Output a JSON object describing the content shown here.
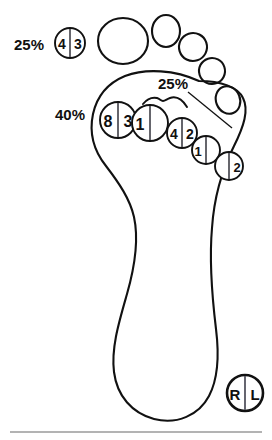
{
  "figure": {
    "laterality": {
      "left_letter": "R",
      "right_letter": "L"
    },
    "percent_labels": [
      {
        "id": "toe-region",
        "text": "25%",
        "x": 14,
        "y": 50
      },
      {
        "id": "midfoot-region",
        "text": "25%",
        "x": 158,
        "y": 89
      },
      {
        "id": "heel-region",
        "text": "40%",
        "x": 55,
        "y": 120
      }
    ],
    "toes": [
      {
        "id": "hallux",
        "cx": 123,
        "cy": 41,
        "rx": 25,
        "ry": 23
      },
      {
        "id": "toe-2",
        "cx": 166,
        "cy": 31,
        "rx": 14,
        "ry": 16
      },
      {
        "id": "toe-3",
        "cx": 193,
        "cy": 47,
        "rx": 14,
        "ry": 14
      },
      {
        "id": "toe-4",
        "cx": 212,
        "cy": 71,
        "rx": 13,
        "ry": 13
      },
      {
        "id": "toe-5",
        "cx": 228,
        "cy": 100,
        "rx": 12,
        "ry": 14
      }
    ],
    "markers": [
      {
        "id": "marker-toe-43",
        "left": "4",
        "right": "3",
        "cx": 70,
        "cy": 43,
        "r": 15,
        "font": 14
      },
      {
        "id": "marker-mtp-83",
        "left": "8",
        "right": "3",
        "cx": 118,
        "cy": 120,
        "r": 18,
        "font": 16
      },
      {
        "id": "marker-mtp-1",
        "left": "1",
        "right": "",
        "cx": 150,
        "cy": 123,
        "r": 18,
        "font": 16
      },
      {
        "id": "marker-mtp-42",
        "left": "4",
        "right": "2",
        "cx": 182,
        "cy": 133,
        "r": 15,
        "font": 14
      },
      {
        "id": "marker-mtp-1b",
        "left": "1",
        "right": "",
        "cx": 206,
        "cy": 150,
        "r": 14,
        "font": 13
      },
      {
        "id": "marker-mtp-2",
        "left": "",
        "right": "2",
        "cx": 229,
        "cy": 166,
        "r": 14,
        "font": 13
      }
    ],
    "bottom_rule": {
      "y": 432
    }
  }
}
